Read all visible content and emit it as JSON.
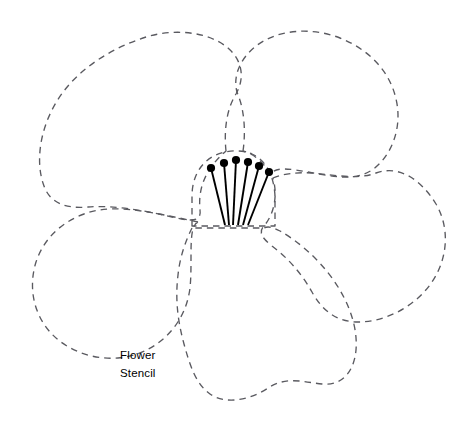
{
  "canvas": {
    "width": 470,
    "height": 422,
    "background": "#ffffff"
  },
  "title": "Flower Stencil",
  "caption": {
    "line1": "Flower",
    "line2": "Stencil",
    "x": 120,
    "y1": 359,
    "y2": 377,
    "color": "#000000",
    "font_size": 11.5
  },
  "style": {
    "outline_color": "#5a5a60",
    "outline_width": 1.35,
    "dash_pattern": "6.5 5",
    "stamen_color": "#000000",
    "stamen_filament_width": 1.9,
    "stamen_dot_radius": 4.1
  },
  "petals": [
    {
      "name": "petal-top-left",
      "d": "M 226 151 C 224 132 226 110 236 94 C 244 80 244 62 228 48 C 208 31 172 28 143 38 C 110 49 76 70 57 101 C 38 132 36 165 44 186 C 50 203 66 209 88 207 C 112 205 143 210 172 217 C 189 221 202 223 200 210 C 198 190 204 170 226 151 Z"
    },
    {
      "name": "petal-top-right",
      "d": "M 243 151 C 246 131 244 109 238 95 C 232 80 238 60 256 46 C 278 29 312 27 340 38 C 370 50 390 72 396 99 C 403 128 391 157 372 170 C 354 182 330 176 308 172 C 290 169 275 166 270 175 C 264 162 254 154 243 151 Z"
    },
    {
      "name": "petal-right",
      "d": "M 273 178 C 282 174 296 172 312 173 C 336 175 358 180 376 173 C 398 165 420 178 436 204 C 450 228 448 258 432 282 C 415 307 385 322 358 322 C 336 322 322 310 312 292 C 302 274 288 258 272 246 C 262 238 258 232 264 226 C 274 214 278 196 273 178 Z"
    },
    {
      "name": "petal-bottom",
      "d": "M 192 228 C 186 240 180 256 178 275 C 175 300 178 322 184 344 C 190 366 196 384 210 394 C 226 405 250 400 268 388 C 286 376 304 382 322 384 C 342 386 354 372 356 350 C 358 326 348 300 332 278 C 316 256 296 240 280 231 C 272 227 268 226 264 228 Z"
    },
    {
      "name": "petal-bottom-left",
      "d": "M 198 222 C 184 219 166 215 148 212 C 124 208 102 207 84 214 C 62 222 44 238 36 262 C 28 288 34 314 50 332 C 66 350 92 360 118 358 C 142 356 160 344 172 330 C 182 318 188 304 190 288 C 192 268 190 248 192 234 C 193 227 195 223 198 222 Z"
    }
  ],
  "center": {
    "name": "flower-center-dome",
    "d": "M 192 226 L 192 196 C 192 178 200 164 212 157 C 224 150 240 149 252 154 C 266 160 274 176 275 196 L 275 226 Z"
  },
  "stamens": [
    {
      "dot_x": 211,
      "dot_y": 168,
      "base_x": 225,
      "base_y": 225
    },
    {
      "dot_x": 224,
      "dot_y": 163,
      "base_x": 229,
      "base_y": 225
    },
    {
      "dot_x": 236,
      "dot_y": 160,
      "base_x": 233,
      "base_y": 225
    },
    {
      "dot_x": 248,
      "dot_y": 162,
      "base_x": 238,
      "base_y": 225
    },
    {
      "dot_x": 259,
      "dot_y": 166,
      "base_x": 243,
      "base_y": 225
    },
    {
      "dot_x": 269,
      "dot_y": 172,
      "base_x": 248,
      "base_y": 225
    }
  ]
}
